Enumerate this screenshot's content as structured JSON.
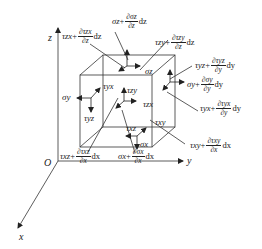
{
  "diagram": {
    "axes": {
      "x": "x",
      "y": "y",
      "z": "z",
      "origin": "O"
    },
    "labels": {
      "tzx_dz": {
        "sym": "τzx",
        "plus": "+",
        "num": "∂τzx",
        "den": "∂z",
        "diff": "dz"
      },
      "sz_dz": {
        "sym": "σz",
        "plus": "+",
        "num": "∂σz",
        "den": "∂z",
        "diff": "dz"
      },
      "tzy_dz": {
        "sym": "τzy",
        "plus": "+",
        "num": "∂τzy",
        "den": "∂z",
        "diff": "dz"
      },
      "tyz_dy": {
        "sym": "τyz",
        "plus": "+",
        "num": "∂τyz",
        "den": "∂y",
        "diff": "dy"
      },
      "sy_dy": {
        "sym": "σy",
        "plus": "+",
        "num": "∂σy",
        "den": "∂y",
        "diff": "dy"
      },
      "tyx_dy": {
        "sym": "τyx",
        "plus": "+",
        "num": "∂τyx",
        "den": "∂y",
        "diff": "dy"
      },
      "txy_dx": {
        "sym": "τxy",
        "plus": "+",
        "num": "∂τxy",
        "den": "∂x",
        "diff": "dx"
      },
      "sx_dx": {
        "sym": "σx",
        "plus": "+",
        "num": "∂σx",
        "den": "∂x",
        "diff": "dx"
      },
      "txz_dx": {
        "sym": "τxz",
        "plus": "+",
        "num": "∂τxz",
        "den": "∂x",
        "diff": "dx"
      }
    },
    "inner": {
      "sigma_y": "σy",
      "tau_yx": "τyx",
      "tau_yz": "τyz",
      "sigma_z": "σz",
      "tau_zy": "τzy",
      "tau_zx": "τzx",
      "tau_xz": "τxz",
      "tau_xy": "τxy",
      "sigma_x": "σx",
      "sigma_z_bottom": "σz"
    }
  }
}
